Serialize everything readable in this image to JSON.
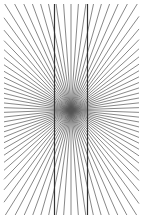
{
  "figure": {
    "width": 143,
    "height": 219,
    "background": "#ffffff",
    "center": {
      "x": 71,
      "y": 110
    },
    "clip_box": {
      "x0": 4,
      "y0": 4,
      "x1": 139,
      "y1": 215
    },
    "rays": {
      "count": 90,
      "angle_step_deg": 4,
      "color": "#555555",
      "stroke_width": 0.7
    },
    "vertical_lines": [
      {
        "name": "left-vertical-line",
        "x": 54.5,
        "y0": 4,
        "y1": 215
      },
      {
        "name": "right-vertical-line",
        "x": 87.5,
        "y0": 4,
        "y1": 215
      }
    ],
    "vertical_line_color": "#333333",
    "vertical_line_width": 1.2
  }
}
